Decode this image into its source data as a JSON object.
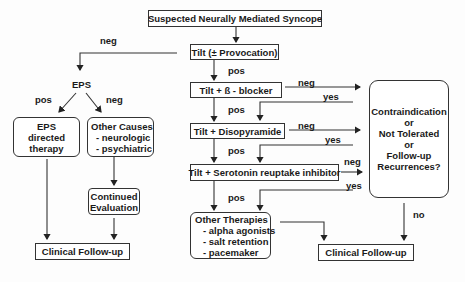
{
  "diagram": {
    "title": "Suspected Neurally Mediated Syncope",
    "nodes": {
      "start": "Suspected Neurally Mediated Syncope",
      "tilt": "Tilt (± Provocation)",
      "tilt_beta": "Tilt + ß - blocker",
      "tilt_diso": "Tilt + Disopyramide",
      "tilt_ssri": "Tilt + Serotonin reuptake inhibitor",
      "eps": "EPS",
      "eps_therapy": [
        "EPS",
        "directed",
        "therapy"
      ],
      "other_causes": {
        "title": "Other Causes",
        "items": [
          "- neurologic",
          "- psychiatric"
        ]
      },
      "continued_eval": [
        "Continued",
        "Evaluation"
      ],
      "clinical_left": "Clinical Follow-up",
      "other_therapies": {
        "title": "Other Therapies",
        "items": [
          "- alpha agonists",
          "- salt retention",
          "- pacemaker"
        ]
      },
      "decision": [
        "Contraindication",
        "or",
        "Not Tolerated",
        "or",
        "Follow-up",
        "Recurrences?"
      ],
      "clinical_right": "Clinical Follow-up"
    },
    "edge_labels": {
      "tilt_neg": "neg",
      "tilt_pos": "pos",
      "beta_neg": "neg",
      "beta_yes": "yes",
      "beta_pos": "pos",
      "diso_neg": "neg",
      "diso_yes": "yes",
      "diso_pos": "pos",
      "ssri_neg": "neg",
      "ssri_yes": "yes",
      "ssri_pos": "pos",
      "eps_pos": "pos",
      "eps_neg": "neg",
      "decision_no": "no"
    }
  }
}
